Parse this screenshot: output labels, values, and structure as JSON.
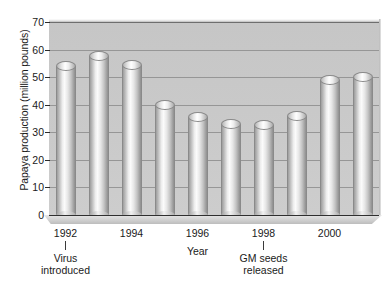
{
  "chart_data": {
    "type": "bar",
    "title": "",
    "xlabel": "Year",
    "ylabel": "Papaya production (million pounds)",
    "categories": [
      "1992",
      "1993",
      "1994",
      "1995",
      "1996",
      "1997",
      "1998",
      "1999",
      "2000",
      "2001"
    ],
    "values": [
      54,
      57.5,
      54.5,
      40,
      35.5,
      33,
      32.5,
      36,
      49,
      50
    ],
    "ylim": [
      0,
      70
    ],
    "yticks": [
      0,
      10,
      20,
      30,
      40,
      50,
      60,
      70
    ],
    "ytick_labels": [
      "0",
      "10",
      "20",
      "30",
      "40",
      "50",
      "60",
      "70"
    ],
    "xticks_labeled": [
      "1992",
      "1994",
      "1996",
      "1998",
      "2000"
    ],
    "grid": true,
    "legend": "none",
    "annotations": [
      {
        "label": "Virus\nintroduced",
        "line1": "Virus",
        "line2": "introduced",
        "at_category": "1992"
      },
      {
        "label": "GM seeds\nreleased",
        "line1": "GM seeds",
        "line2": "released",
        "at_category": "1998"
      }
    ],
    "colors": {
      "plot_background": "#c9c9c9",
      "page_background": "#ffffff",
      "gridline": "#6e6e6e",
      "bar_light": "#fbfbfb",
      "bar_dark": "#8f8f8f",
      "text": "#1a1a1a"
    }
  },
  "axes": {
    "y_title": "Papaya production (million pounds)",
    "x_title": "Year"
  }
}
